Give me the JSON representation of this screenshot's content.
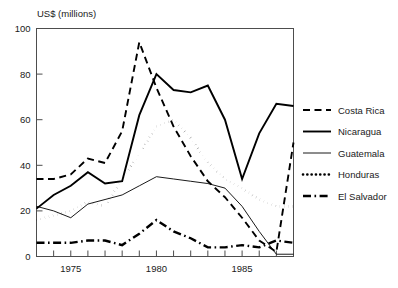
{
  "chart_data": {
    "type": "line",
    "title": "",
    "ylabel": "US$ (millions)",
    "xlabel": "",
    "ylim": [
      0,
      100
    ],
    "xlim": [
      1973,
      1988
    ],
    "yticks": [
      0,
      20,
      40,
      60,
      80,
      100
    ],
    "ytick_labels": [
      "0",
      "20",
      "40",
      "60",
      "80",
      "100"
    ],
    "xticks": [
      1973,
      1974,
      1975,
      1976,
      1977,
      1978,
      1979,
      1980,
      1981,
      1982,
      1983,
      1984,
      1985,
      1986,
      1987,
      1988
    ],
    "xtick_labels": [
      "1975",
      "1980",
      "1985"
    ],
    "xtick_label_years": [
      1975,
      1980,
      1985
    ],
    "grid": false,
    "legend_position": "right",
    "x": [
      1973,
      1974,
      1975,
      1976,
      1977,
      1978,
      1979,
      1980,
      1981,
      1982,
      1983,
      1984,
      1985,
      1986,
      1987,
      1988
    ],
    "series": [
      {
        "name": "Costa Rica",
        "style": "dashed",
        "values": [
          34,
          34,
          36,
          43,
          41,
          55,
          94,
          74,
          57,
          44,
          33,
          26,
          17,
          7,
          2,
          50
        ]
      },
      {
        "name": "Nicaragua",
        "style": "solid",
        "values": [
          21,
          27,
          31,
          37,
          32,
          33,
          62,
          80,
          73,
          72,
          75,
          60,
          34,
          54,
          67,
          66
        ]
      },
      {
        "name": "Guatemala",
        "style": "thin-solid",
        "values": [
          22,
          20,
          17,
          23,
          25,
          27,
          31,
          35,
          34,
          33,
          32,
          30,
          22,
          11,
          1,
          1
        ]
      },
      {
        "name": "Honduras",
        "style": "dotted",
        "values": [
          16,
          18,
          20,
          24,
          22,
          34,
          45,
          57,
          60,
          52,
          41,
          34,
          30,
          25,
          22,
          22
        ]
      },
      {
        "name": "El Salvador",
        "style": "dash-dot",
        "values": [
          6,
          6,
          6,
          7,
          7,
          5,
          10,
          16,
          11,
          8,
          4,
          4,
          5,
          4,
          7,
          6
        ]
      }
    ],
    "legend_entries": [
      {
        "label": "Costa Rica",
        "style": "dashed"
      },
      {
        "label": "Nicaragua",
        "style": "solid"
      },
      {
        "label": "Guatemala",
        "style": "thin-solid"
      },
      {
        "label": "Honduras",
        "style": "dotted"
      },
      {
        "label": "El Salvador",
        "style": "dash-dot"
      }
    ],
    "colors": {
      "ink": "#000000",
      "frame": "#4d4d4d",
      "background": "#ffffff"
    }
  }
}
